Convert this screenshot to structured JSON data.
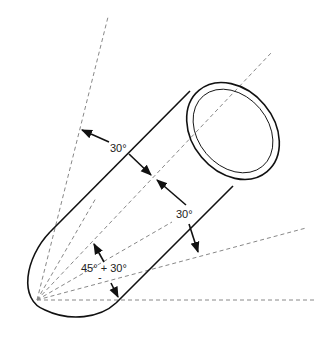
{
  "diagram": {
    "colors": {
      "line": "#111111",
      "dashed": "#888888",
      "text": "#222222",
      "background": "#ffffff"
    },
    "vertex": [
      37,
      300
    ],
    "reference_lines": [
      {
        "name": "horizontal",
        "angle_deg": 0,
        "end": [
          315,
          300
        ]
      },
      {
        "name": "line-15",
        "angle_deg": 15,
        "end": [
          306,
          228
        ]
      },
      {
        "name": "line-30",
        "angle_deg": 30,
        "end": [
          172,
          222
        ]
      },
      {
        "name": "line-60",
        "angle_deg": 60,
        "end": [
          96,
          198
        ]
      },
      {
        "name": "axis-45",
        "angle_deg": 45,
        "end": [
          271,
          53
        ]
      },
      {
        "name": "line-75",
        "angle_deg": 75,
        "end": [
          108,
          17
        ]
      }
    ],
    "labels": {
      "upper_angle": "30°",
      "right_angle": "30°",
      "lower_angle": "45° + 30°",
      "lower_angle_sub": "-"
    }
  }
}
